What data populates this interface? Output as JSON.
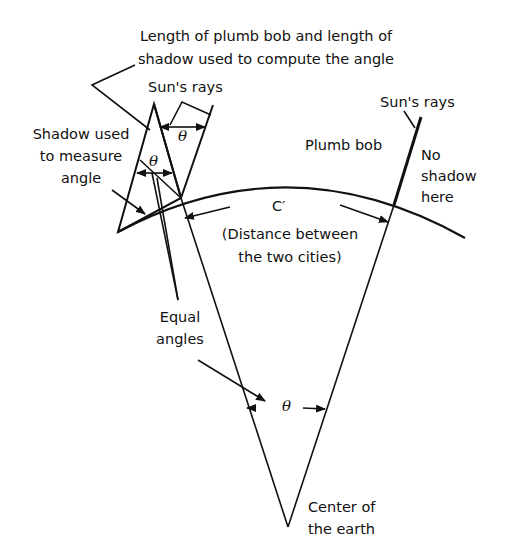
{
  "labels": {
    "top_line1": "Length of plumb bob and length of",
    "top_line2": "shadow used to compute the angle",
    "sun_rays_left": "Sun's rays",
    "sun_rays_right": "Sun's rays",
    "shadow_line1": "Shadow used",
    "shadow_line2": "to measure",
    "shadow_line3": "angle",
    "plumb_bob": "Plumb bob",
    "no_shadow_line1": "No",
    "no_shadow_line2": "shadow",
    "no_shadow_line3": "here",
    "arc_label": "C′",
    "distance_line1": "(Distance between",
    "distance_line2": "the two cities)",
    "equal_line1": "Equal",
    "equal_line2": "angles",
    "center_line1": "Center of",
    "center_line2": "the earth",
    "theta_symbol": "θ"
  },
  "colors": {
    "ink": "#111111",
    "background": "#ffffff"
  }
}
